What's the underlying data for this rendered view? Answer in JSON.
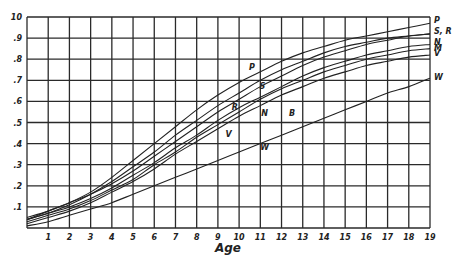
{
  "chart_data": {
    "type": "line",
    "title": "",
    "xlabel": "Age",
    "ylabel": "",
    "xlim": [
      0,
      19
    ],
    "ylim": [
      0,
      1.0
    ],
    "grid": true,
    "legend_position": "right-end labels",
    "x_ticks": [
      "1",
      "2",
      "3",
      "4",
      "5",
      "6",
      "7",
      "8",
      "9",
      "10",
      "11",
      "12",
      "13",
      "14",
      "15",
      "16",
      "17",
      "18",
      "19"
    ],
    "y_ticks": [
      ".1",
      ".2",
      ".3",
      ".4",
      ".5",
      ".6",
      ".7",
      ".8",
      ".9",
      "1.0"
    ],
    "y_tick_top_label": "10",
    "x": [
      0,
      1,
      2,
      3,
      4,
      5,
      6,
      7,
      8,
      9,
      10,
      11,
      12,
      13,
      14,
      15,
      16,
      17,
      18,
      19
    ],
    "series": [
      {
        "name": "P",
        "values": [
          0.04,
          0.08,
          0.12,
          0.17,
          0.24,
          0.32,
          0.4,
          0.48,
          0.56,
          0.63,
          0.69,
          0.74,
          0.79,
          0.83,
          0.86,
          0.89,
          0.91,
          0.93,
          0.95,
          0.97
        ]
      },
      {
        "name": "S",
        "values": [
          0.04,
          0.07,
          0.11,
          0.16,
          0.22,
          0.29,
          0.36,
          0.44,
          0.51,
          0.58,
          0.64,
          0.7,
          0.75,
          0.79,
          0.83,
          0.86,
          0.88,
          0.9,
          0.91,
          0.92
        ]
      },
      {
        "name": "R",
        "values": [
          0.05,
          0.08,
          0.12,
          0.16,
          0.21,
          0.27,
          0.34,
          0.41,
          0.48,
          0.55,
          0.61,
          0.67,
          0.72,
          0.77,
          0.81,
          0.84,
          0.87,
          0.89,
          0.91,
          0.92
        ]
      },
      {
        "name": "N",
        "values": [
          0.04,
          0.07,
          0.1,
          0.14,
          0.19,
          0.25,
          0.31,
          0.38,
          0.44,
          0.51,
          0.57,
          0.62,
          0.67,
          0.72,
          0.76,
          0.79,
          0.82,
          0.84,
          0.86,
          0.87
        ]
      },
      {
        "name": "M",
        "values": [
          0.03,
          0.06,
          0.09,
          0.13,
          0.18,
          0.23,
          0.3,
          0.36,
          0.43,
          0.49,
          0.55,
          0.61,
          0.66,
          0.7,
          0.74,
          0.77,
          0.8,
          0.82,
          0.84,
          0.85
        ]
      },
      {
        "name": "V",
        "values": [
          0.02,
          0.05,
          0.08,
          0.12,
          0.17,
          0.22,
          0.28,
          0.35,
          0.41,
          0.47,
          0.53,
          0.58,
          0.63,
          0.67,
          0.71,
          0.74,
          0.77,
          0.79,
          0.81,
          0.82
        ]
      },
      {
        "name": "W",
        "values": [
          0.01,
          0.03,
          0.06,
          0.09,
          0.12,
          0.16,
          0.2,
          0.24,
          0.28,
          0.32,
          0.36,
          0.4,
          0.44,
          0.48,
          0.52,
          0.56,
          0.6,
          0.64,
          0.67,
          0.71
        ]
      }
    ],
    "inline_labels": [
      {
        "text": "P",
        "x": 10.6,
        "y": 0.75
      },
      {
        "text": "S",
        "x": 11.1,
        "y": 0.66
      },
      {
        "text": "R",
        "x": 9.8,
        "y": 0.56
      },
      {
        "text": "N",
        "x": 11.2,
        "y": 0.53
      },
      {
        "text": "B",
        "x": 12.5,
        "y": 0.53
      },
      {
        "text": "V",
        "x": 9.5,
        "y": 0.43
      },
      {
        "text": "W",
        "x": 11.2,
        "y": 0.37
      }
    ],
    "end_labels": [
      {
        "text": "P",
        "y": 0.985
      },
      {
        "text": "S, R",
        "y": 0.935
      },
      {
        "text": "N",
        "y": 0.88
      },
      {
        "text": "M",
        "y": 0.855
      },
      {
        "text": "V",
        "y": 0.83
      },
      {
        "text": "W",
        "y": 0.715
      }
    ]
  }
}
